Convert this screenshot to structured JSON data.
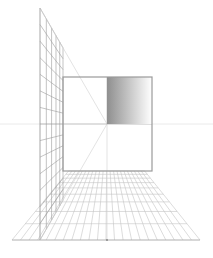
{
  "diagram": {
    "type": "one-point-perspective",
    "background": "#ffffff",
    "vanishing_point": {
      "x": 107,
      "y": 124
    },
    "horizon": {
      "y": 124,
      "x1": 0,
      "x2": 213,
      "color": "#e4e4e4"
    },
    "frame": {
      "x1": 63,
      "y1": 77,
      "x2": 152,
      "y2": 171,
      "stroke": "#9a9a9a",
      "width": 1.2
    },
    "gradient_block": {
      "x1": 107,
      "y1": 77,
      "x2": 152,
      "y2": 124,
      "from": "#8f8f8f",
      "to": "#ffffff"
    },
    "wall": {
      "front_x": 40,
      "front_top": 8,
      "front_bottom": 240,
      "back_x": 63,
      "stroke": "#9c9c9c",
      "rows": 14,
      "cols": 5
    },
    "floor": {
      "front_y": 240,
      "front_x1": 12,
      "front_x2": 200,
      "back_y": 171,
      "rays": 22,
      "rows": 9,
      "stroke": "#c4c4c4",
      "front_stroke": "#b0b0b0"
    },
    "wall_ray_color": "#d0d0d0",
    "center_mark": {
      "x": 107,
      "y": 240
    }
  }
}
